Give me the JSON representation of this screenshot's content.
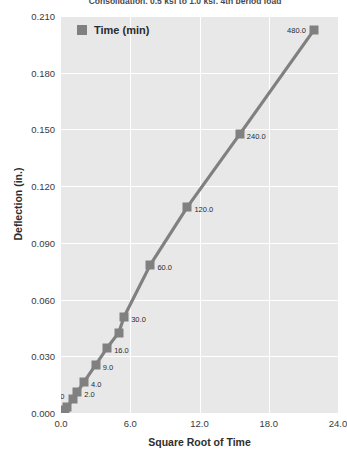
{
  "chart_data": {
    "type": "line",
    "title": "Consolidation, 0.5 ksf to 1.0 ksf, 4th period load",
    "xlabel": "Square Root of Time",
    "ylabel": "Deflection (in.)",
    "xlim": [
      0.0,
      24.0
    ],
    "ylim": [
      0.0,
      0.21
    ],
    "xticks": [
      "0.0",
      "6.0",
      "12.0",
      "18.0",
      "24.0"
    ],
    "xtick_values": [
      0.0,
      6.0,
      12.0,
      18.0,
      24.0
    ],
    "yticks": [
      "0.000",
      "0.030",
      "0.060",
      "0.090",
      "0.120",
      "0.150",
      "0.180",
      "0.210"
    ],
    "ytick_values": [
      0.0,
      0.03,
      0.06,
      0.09,
      0.12,
      0.15,
      0.18,
      0.21
    ],
    "grid": true,
    "legend_position": "top-left-inside",
    "series": [
      {
        "name": "Time (min)",
        "marker": "square",
        "color": "#808080",
        "x": [
          0.316,
          0.548,
          1.0,
          1.414,
          2.0,
          3.0,
          4.0,
          5.0,
          5.477,
          7.746,
          10.954,
          15.492,
          21.909
        ],
        "y": [
          0.0015,
          0.003,
          0.0075,
          0.011,
          0.0165,
          0.0255,
          0.0345,
          0.0425,
          0.051,
          0.0785,
          0.109,
          0.1475,
          0.2025
        ],
        "point_labels": [
          "0.1",
          "0.3",
          "1.0",
          "2.0",
          "4.0",
          "9.0",
          "16.0",
          "",
          "30.0",
          "60.0",
          "120.0",
          "240.0",
          "480.0"
        ]
      }
    ]
  }
}
